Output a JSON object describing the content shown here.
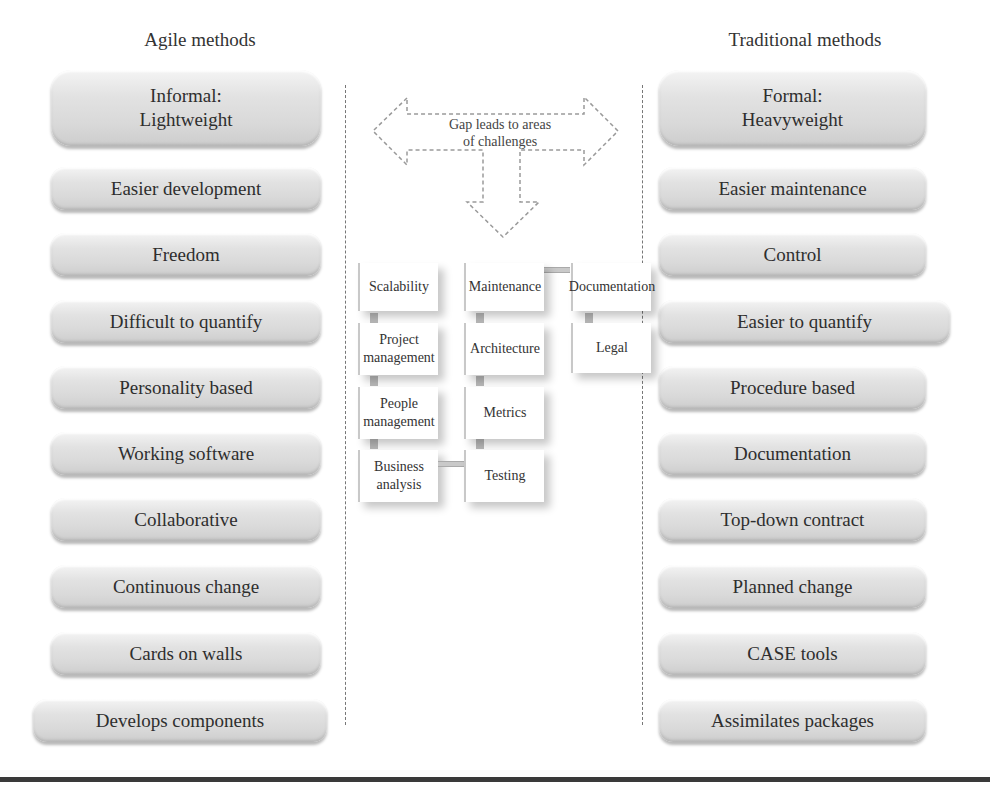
{
  "left_column": {
    "title": "Agile methods",
    "items": [
      {
        "label": "Informal:\nLightweight",
        "line1": "Informal:",
        "line2": "Lightweight"
      },
      {
        "label": "Easier development"
      },
      {
        "label": "Freedom"
      },
      {
        "label": "Difficult to quantify"
      },
      {
        "label": "Personality based"
      },
      {
        "label": "Working software"
      },
      {
        "label": "Collaborative"
      },
      {
        "label": "Continuous change"
      },
      {
        "label": "Cards on walls"
      },
      {
        "label": "Develops components"
      }
    ]
  },
  "right_column": {
    "title": "Traditional methods",
    "items": [
      {
        "label": "Formal:\nHeavyweight",
        "line1": "Formal:",
        "line2": "Heavyweight"
      },
      {
        "label": "Easier maintenance"
      },
      {
        "label": "Control"
      },
      {
        "label": "Easier to quantify"
      },
      {
        "label": "Procedure based"
      },
      {
        "label": "Documentation"
      },
      {
        "label": "Top-down contract"
      },
      {
        "label": "Planned change"
      },
      {
        "label": "CASE tools"
      },
      {
        "label": "Assimilates packages"
      }
    ]
  },
  "center": {
    "arrow_label_line1": "Gap leads to  areas",
    "arrow_label_line2": "of challenges",
    "challenge_columns": [
      [
        {
          "line1": "Scalability",
          "line2": ""
        },
        {
          "line1": "Project",
          "line2": "management"
        },
        {
          "line1": "People",
          "line2": "management"
        },
        {
          "line1": "Business",
          "line2": "analysis"
        }
      ],
      [
        {
          "line1": "Maintenance",
          "line2": ""
        },
        {
          "line1": "Architecture",
          "line2": ""
        },
        {
          "line1": "Metrics",
          "line2": ""
        },
        {
          "line1": "Testing",
          "line2": ""
        }
      ],
      [
        {
          "line1": "Documentation",
          "line2": ""
        },
        {
          "line1": "Legal",
          "line2": ""
        }
      ]
    ]
  },
  "caption": {
    "text": "(caption text cropped at bottom edge; not legible)"
  },
  "colors": {
    "pill_light": "#f4f4f4",
    "pill_dark": "#cdcdcd",
    "text": "#2e2e2e",
    "divider": "#777777",
    "rule": "#3a3a3a"
  }
}
